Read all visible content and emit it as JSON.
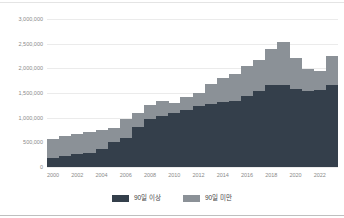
{
  "page": {
    "background": "#ffffff",
    "top_border_color": "#e4e4e4",
    "bottom_border_color": "#bfbfbf"
  },
  "chart_data": {
    "type": "bar",
    "stacked": true,
    "title": "",
    "xlabel": "",
    "ylabel": "",
    "x": [
      2000,
      2001,
      2002,
      2003,
      2004,
      2005,
      2006,
      2007,
      2008,
      2009,
      2010,
      2011,
      2012,
      2013,
      2014,
      2015,
      2016,
      2017,
      2018,
      2019,
      2020,
      2021,
      2022,
      2023
    ],
    "series": [
      {
        "name": "90일 이상",
        "color": "#343f4b",
        "values": [
          190000,
          215000,
          255000,
          290000,
          365000,
          510000,
          590000,
          820000,
          980000,
          1030000,
          1100000,
          1165000,
          1230000,
          1270000,
          1310000,
          1340000,
          1440000,
          1545000,
          1660000,
          1665000,
          1585000,
          1540000,
          1570000,
          1660000
        ]
      },
      {
        "name": "90일 미만",
        "color": "#8b9197",
        "values": [
          380000,
          405000,
          405000,
          420000,
          395000,
          290000,
          390000,
          280000,
          270000,
          300000,
          190000,
          255000,
          275000,
          410000,
          490000,
          550000,
          610000,
          625000,
          740000,
          865000,
          635000,
          450000,
          380000,
          600000
        ]
      }
    ],
    "x_ticks": [
      "2000",
      "2002",
      "2004",
      "2006",
      "2008",
      "2010",
      "2012",
      "2014",
      "2016",
      "2018",
      "2020",
      "2022"
    ],
    "y_ticks": [
      {
        "value": 0,
        "label": "0"
      },
      {
        "value": 500000,
        "label": "500,000"
      },
      {
        "value": 1000000,
        "label": "1,000,000"
      },
      {
        "value": 1500000,
        "label": "1,500,000"
      },
      {
        "value": 2000000,
        "label": "2,000,000"
      },
      {
        "value": 2500000,
        "label": "2,500,000"
      },
      {
        "value": 3000000,
        "label": "3,000,000"
      }
    ],
    "ylim": [
      0,
      3000000
    ],
    "grid": "horizontal",
    "grid_color": "#ebebeb",
    "axis_text_color": "#8a8a8a",
    "legend_position": "bottom"
  }
}
